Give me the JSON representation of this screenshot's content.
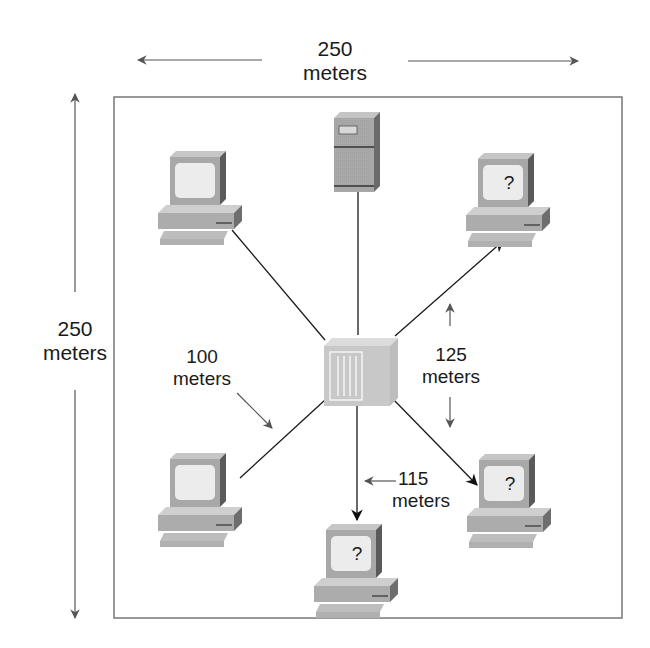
{
  "diagram": {
    "type": "network-topology",
    "area": {
      "width_label": "250",
      "height_label": "250",
      "unit": "meters"
    },
    "labels": {
      "top_dimension": {
        "value": "250",
        "unit": "meters"
      },
      "left_dimension": {
        "value": "250",
        "unit": "meters"
      },
      "link_100": {
        "value": "100",
        "unit": "meters"
      },
      "link_125": {
        "value": "125",
        "unit": "meters"
      },
      "link_115": {
        "value": "115",
        "unit": "meters"
      }
    },
    "nodes": [
      {
        "id": "server",
        "kind": "server",
        "label": ""
      },
      {
        "id": "hub",
        "kind": "hub",
        "label": ""
      },
      {
        "id": "pc-top-left",
        "kind": "workstation",
        "screen": ""
      },
      {
        "id": "pc-top-right",
        "kind": "workstation",
        "screen": "?"
      },
      {
        "id": "pc-bottom-left",
        "kind": "workstation",
        "screen": ""
      },
      {
        "id": "pc-bottom-center",
        "kind": "workstation",
        "screen": "?"
      },
      {
        "id": "pc-bottom-right",
        "kind": "workstation",
        "screen": "?"
      }
    ],
    "links": [
      {
        "from": "hub",
        "to": "server",
        "arrow": false
      },
      {
        "from": "hub",
        "to": "pc-top-left",
        "arrow": false
      },
      {
        "from": "hub",
        "to": "pc-bottom-left",
        "arrow": false,
        "distance": "100 meters"
      },
      {
        "from": "hub",
        "to": "pc-top-right",
        "arrow": true,
        "distance": "125 meters"
      },
      {
        "from": "hub",
        "to": "pc-bottom-right",
        "arrow": true,
        "distance": "125 meters"
      },
      {
        "from": "hub",
        "to": "pc-bottom-center",
        "arrow": true,
        "distance": "115 meters"
      }
    ],
    "colors": {
      "line": "#1a1a1a",
      "dimension": "#555555",
      "box": "#777777",
      "device_light": "#d4d4d4",
      "device_mid": "#a9a9a9",
      "device_dark": "#5e5e5e",
      "screen": "#ececec"
    }
  }
}
